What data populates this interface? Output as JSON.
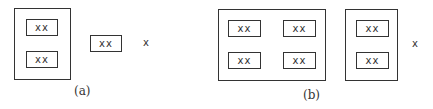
{
  "panels": [
    {
      "caption": "(a)",
      "group_label": "xx",
      "outer_box": {
        "items": [
          "xx",
          "xx"
        ]
      },
      "single_box": "xx",
      "loose_item": "x"
    },
    {
      "caption": "(b)",
      "big_box": {
        "items": [
          "xx",
          "xx",
          "xx",
          "xx"
        ]
      },
      "tall_box": {
        "items": [
          "xx",
          "xx"
        ]
      },
      "loose_item": "x"
    }
  ]
}
